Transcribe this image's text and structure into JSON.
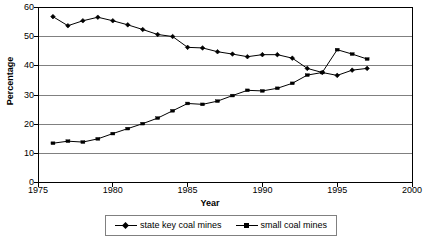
{
  "chart_data": {
    "type": "line",
    "title": "",
    "xlabel": "Year",
    "ylabel": "Percentage",
    "xlim": [
      1975,
      2000
    ],
    "ylim": [
      0,
      60
    ],
    "xticks": [
      1975,
      1980,
      1985,
      1990,
      1995,
      2000
    ],
    "yticks": [
      0,
      10,
      20,
      30,
      40,
      50,
      60
    ],
    "grid": "horizontal",
    "legend_position": "bottom",
    "x": [
      1976,
      1977,
      1978,
      1979,
      1980,
      1981,
      1982,
      1983,
      1984,
      1985,
      1986,
      1987,
      1988,
      1989,
      1990,
      1991,
      1992,
      1993,
      1994,
      1995,
      1996,
      1997
    ],
    "series": [
      {
        "name": "state key coal mines",
        "marker": "diamond",
        "values": [
          56.8,
          53.7,
          55.4,
          56.6,
          55.4,
          54.0,
          52.4,
          50.7,
          50.0,
          46.3,
          46.1,
          44.8,
          44.0,
          43.1,
          43.8,
          43.8,
          42.6,
          39.1,
          37.7,
          36.7,
          38.5,
          39.1
        ]
      },
      {
        "name": "small coal mines",
        "marker": "square",
        "values": [
          13.5,
          14.2,
          13.9,
          15.0,
          16.8,
          18.5,
          20.2,
          22.1,
          24.6,
          27.1,
          26.8,
          27.9,
          29.8,
          31.6,
          31.4,
          32.3,
          34.0,
          36.8,
          37.7,
          45.5,
          44.0,
          42.3
        ]
      }
    ]
  },
  "legend": {
    "items": [
      {
        "label": "state key coal mines",
        "marker": "diamond"
      },
      {
        "label": "small coal mines",
        "marker": "square"
      }
    ]
  },
  "colors": {
    "series_line": "#000000",
    "gridline": "#808080",
    "axis": "#000000",
    "plot_background": "#ffffff",
    "legend_border": "#808080"
  }
}
